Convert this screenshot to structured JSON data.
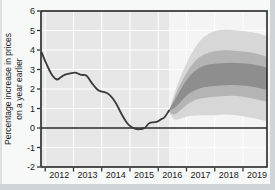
{
  "chart_data": {
    "type": "area",
    "subtype": "fan-chart",
    "title": "",
    "xlabel": "",
    "ylabel_lines": [
      "Percentage increase in prices",
      "on a year earlier"
    ],
    "xlim": [
      2011.85,
      2019.85
    ],
    "ylim": [
      -2,
      6
    ],
    "y_ticks": [
      -2,
      -1,
      0,
      1,
      2,
      3,
      4,
      5,
      6
    ],
    "x_ticks": [
      2012,
      2013,
      2014,
      2015,
      2016,
      2017,
      2018,
      2019
    ],
    "x_tick_labels": [
      "2012",
      "2013",
      "2014",
      "2015",
      "2016",
      "2017",
      "2018",
      "2019"
    ],
    "grid": true,
    "forecast_start": 2016.38,
    "history_series": {
      "name": "inflation-outturn",
      "points": [
        [
          2011.88,
          3.85
        ],
        [
          2011.95,
          3.6
        ],
        [
          2012.05,
          3.25
        ],
        [
          2012.2,
          2.8
        ],
        [
          2012.3,
          2.6
        ],
        [
          2012.42,
          2.45
        ],
        [
          2012.55,
          2.6
        ],
        [
          2012.7,
          2.75
        ],
        [
          2012.9,
          2.8
        ],
        [
          2013.05,
          2.85
        ],
        [
          2013.15,
          2.8
        ],
        [
          2013.3,
          2.7
        ],
        [
          2013.45,
          2.75
        ],
        [
          2013.6,
          2.4
        ],
        [
          2013.75,
          2.1
        ],
        [
          2013.9,
          1.9
        ],
        [
          2014.05,
          1.85
        ],
        [
          2014.2,
          1.8
        ],
        [
          2014.35,
          1.6
        ],
        [
          2014.5,
          1.3
        ],
        [
          2014.65,
          0.85
        ],
        [
          2014.8,
          0.45
        ],
        [
          2014.95,
          0.15
        ],
        [
          2015.1,
          0.0
        ],
        [
          2015.25,
          -0.07
        ],
        [
          2015.4,
          -0.05
        ],
        [
          2015.55,
          0.0
        ],
        [
          2015.65,
          0.25
        ],
        [
          2015.8,
          0.3
        ],
        [
          2015.95,
          0.3
        ],
        [
          2016.1,
          0.45
        ],
        [
          2016.2,
          0.5
        ],
        [
          2016.3,
          0.7
        ],
        [
          2016.38,
          0.9
        ]
      ]
    },
    "fan_x": [
      2016.38,
      2016.55,
      2016.75,
      2017.0,
      2017.3,
      2017.6,
      2018.0,
      2018.4,
      2018.8,
      2019.2,
      2019.55,
      2019.85
    ],
    "fan_bands": [
      {
        "name": "outer",
        "color": "#d7d7d7",
        "top": [
          0.9,
          1.7,
          2.5,
          3.35,
          4.15,
          4.7,
          5.0,
          5.05,
          5.0,
          4.95,
          4.85,
          4.7
        ],
        "bottom": [
          0.8,
          0.4,
          0.45,
          0.6,
          0.65,
          0.65,
          0.65,
          0.7,
          0.65,
          0.55,
          0.45,
          0.35
        ]
      },
      {
        "name": "middle",
        "color": "#b4b4b4",
        "top": [
          0.9,
          1.5,
          2.15,
          2.85,
          3.45,
          3.8,
          3.95,
          4.0,
          3.95,
          3.9,
          3.8,
          3.65
        ],
        "bottom": [
          0.85,
          0.65,
          0.85,
          1.2,
          1.45,
          1.55,
          1.6,
          1.65,
          1.65,
          1.55,
          1.45,
          1.35
        ]
      },
      {
        "name": "inner",
        "color": "#8e8e8e",
        "top": [
          0.9,
          1.35,
          1.85,
          2.5,
          2.95,
          3.2,
          3.3,
          3.35,
          3.35,
          3.3,
          3.2,
          3.1
        ],
        "bottom": [
          0.88,
          1.0,
          1.25,
          1.7,
          1.95,
          2.1,
          2.15,
          2.2,
          2.2,
          2.15,
          2.05,
          1.95
        ]
      }
    ],
    "colors": {
      "history_background": "#e7e7e7",
      "forecast_background": "#f4f4f4",
      "gridline": "#ffffff",
      "line": "#3a3a3a",
      "axis": "#262626",
      "text": "#1a1a1a"
    }
  }
}
